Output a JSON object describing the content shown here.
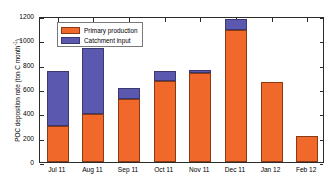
{
  "chart_data": {
    "type": "bar",
    "barmode": "stacked",
    "title": "",
    "xlabel": "",
    "ylabel": "POC deposition rate (ton C month⁻¹)",
    "ylabel_main": "POC deposition rate (ton C month",
    "ylabel_exponent": "-1",
    "ylabel_close": ")",
    "categories": [
      "Jul 11",
      "Aug 11",
      "Sep 11",
      "Oct 11",
      "Nov 11",
      "Dec 11",
      "Jan 12",
      "Feb 12"
    ],
    "series": [
      {
        "name": "Primary production",
        "color": "#F0692A",
        "edge_color": "#8a3a14",
        "values": [
          296,
          394,
          520,
          665,
          735,
          1082,
          655,
          210
        ]
      },
      {
        "name": "Catchment input",
        "color": "#5B58B0",
        "edge_color": "#3b3870",
        "values": [
          454,
          543,
          85,
          85,
          22,
          93,
          0,
          0
        ]
      }
    ],
    "totals": [
      750,
      937,
      605,
      750,
      757,
      1175,
      655,
      210
    ],
    "ylim": [
      0,
      1200
    ],
    "yticks": [
      0,
      200,
      400,
      600,
      800,
      1000,
      1200
    ],
    "ytick_labels": [
      "0",
      "200",
      "400",
      "600",
      "800",
      "1000",
      "1200"
    ],
    "grid": false,
    "legend_position": "upper-left",
    "axis_color": "#2b2b2b"
  }
}
